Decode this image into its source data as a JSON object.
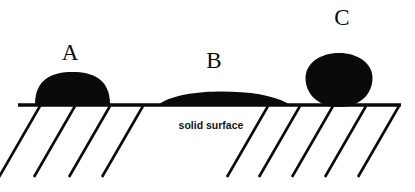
{
  "figure": {
    "background_color": "#ffffff",
    "ink_color": "#0a0a0a",
    "width": 415,
    "height": 192
  },
  "surface": {
    "label": "solid surface",
    "label_x": 211,
    "label_y": 129,
    "line_y": 105,
    "line_x1": 18,
    "line_x2": 401,
    "hatch_angle_deg": 60,
    "hatch_length": 82,
    "hatch_starts_left": [
      40,
      75,
      110,
      143
    ],
    "hatch_starts_right": [
      268,
      300,
      333,
      366,
      399
    ]
  },
  "labels": [
    {
      "text": "A",
      "x": 70,
      "y": 60
    },
    {
      "text": "B",
      "x": 214,
      "y": 68
    },
    {
      "text": "C",
      "x": 342,
      "y": 25
    }
  ],
  "droplets": [
    {
      "id": "droplet-a",
      "label": "A",
      "description": "hemispherical droplet, intermediate contact angle",
      "contact_angle_deg": 90,
      "base_left_x": 35,
      "base_right_x": 110,
      "apex_y": 72,
      "base_y": 105,
      "path": "M 35 104.5 C 35 79 52 72 72.5 72 C 93 72 110 79 110 104.5 Z"
    },
    {
      "id": "droplet-b",
      "label": "B",
      "description": "flattened lens droplet, low contact angle, good wetting",
      "contact_angle_deg": 20,
      "base_left_x": 159,
      "base_right_x": 287,
      "apex_y": 92,
      "base_y": 105,
      "path": "M 159 104.5 C 168 97 190 92 218 91.6 C 248 91.3 272 95 287 103 C 288 104 287.5 104.5 286 104.5 Z"
    },
    {
      "id": "droplet-c",
      "label": "C",
      "description": "near-spherical droplet, high contact angle, poor wetting",
      "contact_angle_deg": 150,
      "base_left_x": 312,
      "base_right_x": 366,
      "apex_y": 53,
      "base_y": 107,
      "path": "M 305.5 78 C 305.5 63.5 320 53 339 53 C 358 53 372.5 63.5 372.5 78 C 372.5 94 360 107 339 107 C 318 107 305.5 94 305.5 78 Z"
    }
  ]
}
